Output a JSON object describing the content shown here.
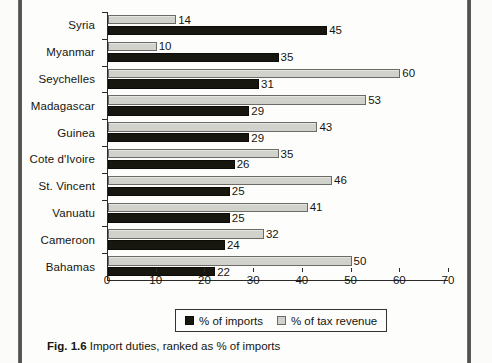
{
  "figure": {
    "caption_label": "Fig. 1.6",
    "caption_text": "Import duties, ranked as % of imports"
  },
  "legend": {
    "items": [
      {
        "label": "% of imports",
        "color": "#17160f",
        "swatch": "black-square-icon"
      },
      {
        "label": "% of tax revenue",
        "color": "#d2d2cd",
        "swatch": "gray-square-icon"
      }
    ]
  },
  "axis": {
    "x_ticks": [
      "0",
      "10",
      "20",
      "30",
      "40",
      "50",
      "60",
      "70"
    ]
  },
  "chart_data": {
    "type": "bar",
    "orientation": "horizontal",
    "title": "Import duties, ranked as % of imports",
    "xlabel": "",
    "ylabel": "",
    "xlim": [
      0,
      70
    ],
    "xticks": [
      0,
      10,
      20,
      30,
      40,
      50,
      60,
      70
    ],
    "grid": false,
    "legend_position": "bottom",
    "categories": [
      "Syria",
      "Myanmar",
      "Seychelles",
      "Madagascar",
      "Guinea",
      "Cote d'Ivoire",
      "St. Vincent",
      "Vanuatu",
      "Cameroon",
      "Bahamas"
    ],
    "series": [
      {
        "name": "% of tax revenue",
        "color": "#d2d2cd",
        "values": [
          14,
          10,
          60,
          53,
          43,
          35,
          46,
          41,
          32,
          50
        ]
      },
      {
        "name": "% of imports",
        "color": "#17160f",
        "values": [
          45,
          35,
          31,
          29,
          29,
          26,
          25,
          25,
          24,
          22
        ]
      }
    ]
  }
}
